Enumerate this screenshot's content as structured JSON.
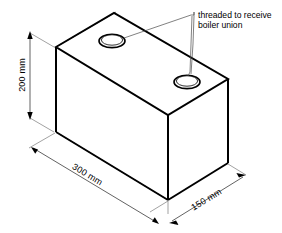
{
  "diagram": {
    "background_color": "#ffffff",
    "line_color": "#000000",
    "thin_line_color": "#5b5b5b"
  },
  "annotation": {
    "line1": "threaded to receive",
    "line2": "boiler union"
  },
  "dimensions": {
    "height": "200 mm",
    "length": "300 mm",
    "depth": "150 mm"
  },
  "features": {
    "hole_back_label": "threaded-hole-back",
    "hole_front_label": "threaded-hole-front"
  }
}
